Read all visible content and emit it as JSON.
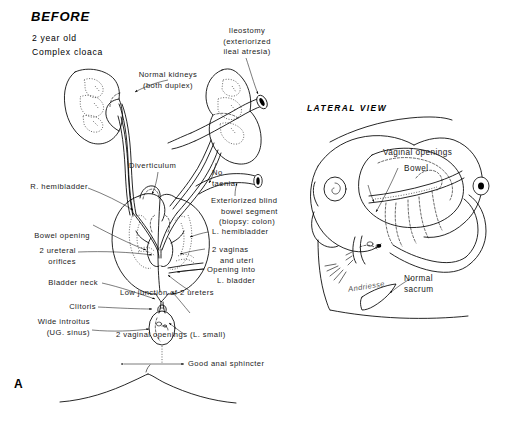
{
  "figure": {
    "panel_letter": "A",
    "title": "BEFORE",
    "subtitle_line1": "2 year old",
    "subtitle_line2": "Complex cloaca",
    "lateral_view_title": "LATERAL VIEW",
    "signature": "Andriesse",
    "background_color": "#ffffff",
    "ink_color": "#000000"
  },
  "anterior_view": {
    "labels": {
      "kidneys_line1": "Normal kidneys",
      "kidneys_line2": "(both duplex)",
      "ileostomy_line1": "Ileostomy",
      "ileostomy_line2": "(exteriorized",
      "ileostomy_line3": "ileal atresia)",
      "diverticulum": "Diverticulum",
      "no_taenia_line1": "No",
      "no_taenia_line2": "taenia",
      "blind_segment_line1": "Exteriorized blind",
      "blind_segment_line2": "bowel segment",
      "blind_segment_line3": "(biopsy: colon)",
      "r_hemibladder": "R. hemibladder",
      "l_hemibladder": "L. hemibladder",
      "bowel_opening": "Bowel opening",
      "two_vaginas_line1": "2 vaginas",
      "two_vaginas_line2": "and uteri",
      "ureteral_orifices_line1": "2 ureteral",
      "ureteral_orifices_line2": "orifices",
      "opening_into_line1": "Opening into",
      "opening_into_line2": "L. bladder",
      "bladder_neck": "Bladder neck",
      "low_junction": "Low junction of 2 ureters",
      "clitoris": "Clitoris",
      "vaginal_openings_ant": "2 vaginal openings (L. small)",
      "introitus_line1": "Wide introitus",
      "introitus_line2": "(UG. sinus)",
      "anal_sphincter": "Good anal sphincter"
    }
  },
  "lateral_view": {
    "labels": {
      "vaginal_openings": "Vaginal openings",
      "bowel": "Bowel",
      "sacrum_line1": "Normal",
      "sacrum_line2": "sacrum"
    }
  }
}
